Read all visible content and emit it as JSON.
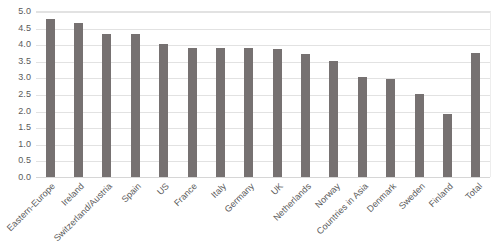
{
  "chart_data": {
    "type": "bar",
    "title": "",
    "subtitle": "",
    "xlabel": "",
    "ylabel": "",
    "ylim": [
      0.0,
      5.0
    ],
    "ytick_step": 0.5,
    "grid": "horizontal",
    "legend": "none",
    "bar_color": "#767171",
    "gridline_color": "#e2e2e2",
    "label_color": "#5a5a5a",
    "xtick_rotation": -45,
    "categories": [
      "Eastern-Europe",
      "Ireland",
      "Switzerland/Austria",
      "Spain",
      "US",
      "France",
      "Italy",
      "Germany",
      "UK",
      "Netherlands",
      "Norway",
      "Countries in Asia",
      "Denmark",
      "Sweden",
      "Finland",
      "Total"
    ],
    "values": [
      4.75,
      4.65,
      4.3,
      4.3,
      4.0,
      3.9,
      3.9,
      3.88,
      3.85,
      3.7,
      3.5,
      3.0,
      2.95,
      2.5,
      1.9,
      3.75
    ],
    "ytick_labels": [
      "5.0",
      "4.5",
      "4.0",
      "3.5",
      "3.0",
      "2.5",
      "2.0",
      "1.5",
      "1.0",
      "0.5",
      "0.0"
    ],
    "ytick_values": [
      5.0,
      4.5,
      4.0,
      3.5,
      3.0,
      2.5,
      2.0,
      1.5,
      1.0,
      0.5,
      0.0
    ]
  }
}
